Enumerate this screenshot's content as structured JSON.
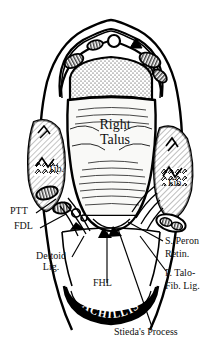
{
  "figure": {
    "title": "Right Talus",
    "view": "posterior cross-section of right ankle",
    "background_color": "#ffffff",
    "ink_color": "#000000"
  },
  "center_label": {
    "line1": "Right",
    "line2": "Talus"
  },
  "bone_labels": [
    {
      "id": "tibia",
      "text": "Tib."
    },
    {
      "id": "fibula",
      "text": "Fib."
    }
  ],
  "left_labels": [
    {
      "id": "ptt",
      "text": "PTT"
    },
    {
      "id": "fdl",
      "text": "FDL"
    },
    {
      "id": "deltoid-lig-line1",
      "text": "Deltoid"
    },
    {
      "id": "deltoid-lig-line2",
      "text": "Lig."
    }
  ],
  "bottom_labels": [
    {
      "id": "fhl",
      "text": "FHL"
    },
    {
      "id": "achillis",
      "text": "ACHILLIS"
    },
    {
      "id": "stiedas-process",
      "text": "Stieda's Process"
    }
  ],
  "right_labels": [
    {
      "id": "superior-peroneal-retinaculum-line1",
      "text": "S. Peron"
    },
    {
      "id": "superior-peroneal-retinaculum-line2",
      "text": "Retin."
    },
    {
      "id": "posterior-talofibular-lig-line1",
      "text": "P. Talo-"
    },
    {
      "id": "posterior-talofibular-lig-line2",
      "text": "Fib. Lig."
    }
  ],
  "colors": {
    "ink": "#000000",
    "paper": "#ffffff",
    "bone_fill": "#f7f7f4",
    "tendon_fill": "#111111"
  }
}
